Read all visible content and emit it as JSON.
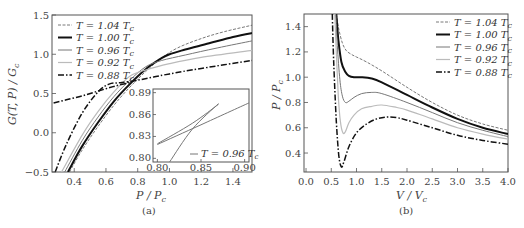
{
  "chart_data": [
    {
      "id": "a",
      "type": "line",
      "caption": "(a)",
      "xlabel": "P / P_c",
      "xlabel_main": "P / P",
      "xlabel_sub": "c",
      "ylabel": "G(T, P) / G_c",
      "ylabel_main": "G(T, P) / G",
      "ylabel_sub": "c",
      "xlim": [
        0.26,
        1.52
      ],
      "ylim": [
        -0.5,
        1.5
      ],
      "xticks": [
        0.4,
        0.6,
        0.8,
        1.0,
        1.2,
        1.4
      ],
      "xtick_labels": [
        "0.4",
        "0.6",
        "0.8",
        "1.0",
        "1.2",
        "1.4"
      ],
      "yticks": [
        -0.5,
        0.0,
        0.5,
        1.0,
        1.5
      ],
      "ytick_labels": [
        "−0.5",
        "0.0",
        "0.5",
        "1.0",
        "1.5"
      ],
      "grid": false,
      "legend_position": "upper left",
      "series": [
        {
          "name": "T = 1.04 T_c",
          "label_main": "T = 1.04 T",
          "label_sub": "c",
          "style": "dashed-thin",
          "color": "#555555",
          "x": [
            0.37,
            0.45,
            0.55,
            0.65,
            0.75,
            0.85,
            0.95,
            1.05,
            1.2,
            1.35,
            1.52
          ],
          "y": [
            -0.5,
            -0.22,
            0.08,
            0.35,
            0.58,
            0.78,
            0.95,
            1.08,
            1.2,
            1.29,
            1.37
          ]
        },
        {
          "name": "T = 1.00 T_c",
          "label_main": "T = 1.00 T",
          "label_sub": "c",
          "style": "solid-thick",
          "color": "#111111",
          "x": [
            0.36,
            0.45,
            0.55,
            0.65,
            0.75,
            0.85,
            0.95,
            1.0,
            1.1,
            1.25,
            1.4,
            1.52
          ],
          "y": [
            -0.5,
            -0.17,
            0.13,
            0.4,
            0.62,
            0.81,
            0.95,
            1.0,
            1.06,
            1.14,
            1.22,
            1.27
          ]
        },
        {
          "name": "T = 0.96 T_c",
          "label_main": "T = 0.96 T",
          "label_sub": "c",
          "style": "solid-medium",
          "color": "#777777",
          "x": [
            0.34,
            0.45,
            0.55,
            0.65,
            0.75,
            0.85,
            0.95,
            1.1,
            1.3,
            1.52
          ],
          "y": [
            -0.5,
            -0.1,
            0.2,
            0.46,
            0.67,
            0.84,
            0.92,
            0.99,
            1.08,
            1.17
          ]
        },
        {
          "name": "T = 0.92 T_c",
          "label_main": "T = 0.92 T",
          "label_sub": "c",
          "style": "solid-light",
          "color": "#bbbbbb",
          "x": [
            0.32,
            0.45,
            0.55,
            0.65,
            0.75,
            0.85,
            1.0,
            1.2,
            1.52
          ],
          "y": [
            -0.5,
            -0.03,
            0.27,
            0.52,
            0.72,
            0.8,
            0.88,
            0.96,
            1.05
          ]
        },
        {
          "name": "T = 0.88 T_c",
          "label_main": "T = 0.88 T",
          "label_sub": "c",
          "style": "dashdot-thick",
          "color": "#111111",
          "x": [
            0.28,
            0.35,
            0.45,
            0.55,
            0.62,
            0.7,
            0.8,
            0.9,
            1.0,
            1.2,
            1.52
          ],
          "y": [
            -0.5,
            -0.15,
            0.25,
            0.52,
            0.62,
            0.64,
            0.67,
            0.71,
            0.75,
            0.82,
            0.92
          ]
        },
        {
          "name": "T = 0.88 T_c (metastable branch)",
          "style": "dashdot-thick",
          "color": "#111111",
          "legend": false,
          "x": [
            0.27,
            0.35,
            0.45,
            0.55,
            0.65,
            0.75
          ],
          "y": [
            0.38,
            0.42,
            0.47,
            0.53,
            0.59,
            0.64
          ]
        }
      ],
      "inset": {
        "xlim": [
          0.795,
          0.905
        ],
        "ylim": [
          0.795,
          0.895
        ],
        "xticks": [
          0.8,
          0.85,
          0.9
        ],
        "xtick_labels": [
          "0.80",
          "0.85",
          "0.90"
        ],
        "yticks": [
          0.8,
          0.83,
          0.86,
          0.89
        ],
        "ytick_labels": [
          "0.80",
          "0.83",
          "0.86",
          "0.89"
        ],
        "legend_main": "T = 0.96 T",
        "legend_sub": "c",
        "series": [
          {
            "name": "branch-1",
            "x": [
              0.8,
              0.84,
              0.87
            ],
            "y": [
              0.82,
              0.848,
              0.874
            ]
          },
          {
            "name": "branch-2",
            "x": [
              0.8,
              0.85,
              0.905
            ],
            "y": [
              0.819,
              0.846,
              0.876
            ]
          },
          {
            "name": "branch-3",
            "x": [
              0.814,
              0.84,
              0.87
            ],
            "y": [
              0.795,
              0.84,
              0.875
            ]
          }
        ]
      }
    },
    {
      "id": "b",
      "type": "line",
      "caption": "(b)",
      "xlabel": "V / V_c",
      "xlabel_main": "V / V",
      "xlabel_sub": "c",
      "ylabel": "P / P_c",
      "ylabel_main": "P / P",
      "ylabel_sub": "c",
      "xlim": [
        -0.04,
        4.0
      ],
      "ylim": [
        0.25,
        1.5
      ],
      "xticks": [
        0.0,
        0.5,
        1.0,
        1.5,
        2.0,
        2.5,
        3.0,
        3.5,
        4.0
      ],
      "xtick_labels": [
        "0.0",
        "0.5",
        "1.0",
        "1.5",
        "2.0",
        "2.5",
        "3.0",
        "3.5",
        "4.0"
      ],
      "yticks": [
        0.4,
        0.6,
        0.8,
        1.0,
        1.2,
        1.4
      ],
      "ytick_labels": [
        "0.4",
        "0.6",
        "0.8",
        "1.0",
        "1.2",
        "1.4"
      ],
      "grid": false,
      "legend_position": "upper right",
      "series": [
        {
          "name": "T = 1.04 T_c",
          "label_main": "T = 1.04 T",
          "label_sub": "c",
          "style": "dashed-thin",
          "color": "#555555",
          "x": [
            0.6,
            0.65,
            0.72,
            0.8,
            0.9,
            1.0,
            1.2,
            1.5,
            2.0,
            2.5,
            3.0,
            3.5,
            4.0
          ],
          "y": [
            1.5,
            1.38,
            1.27,
            1.21,
            1.18,
            1.16,
            1.12,
            1.05,
            0.92,
            0.8,
            0.7,
            0.63,
            0.58
          ]
        },
        {
          "name": "T = 1.00 T_c",
          "label_main": "T = 1.00 T",
          "label_sub": "c",
          "style": "solid-thick",
          "color": "#111111",
          "x": [
            0.6,
            0.64,
            0.7,
            0.78,
            0.85,
            0.95,
            1.1,
            1.3,
            1.5,
            2.0,
            2.5,
            3.0,
            3.5,
            4.0
          ],
          "y": [
            1.5,
            1.3,
            1.12,
            1.04,
            1.01,
            1.0,
            1.0,
            0.99,
            0.96,
            0.86,
            0.76,
            0.67,
            0.6,
            0.55
          ]
        },
        {
          "name": "T = 0.96 T_c",
          "label_main": "T = 0.96 T",
          "label_sub": "c",
          "style": "solid-medium",
          "color": "#777777",
          "x": [
            0.59,
            0.62,
            0.67,
            0.72,
            0.78,
            0.85,
            0.95,
            1.1,
            1.3,
            1.5,
            2.0,
            2.5,
            3.0,
            3.5,
            4.0
          ],
          "y": [
            1.5,
            1.25,
            0.98,
            0.85,
            0.8,
            0.81,
            0.84,
            0.87,
            0.88,
            0.87,
            0.8,
            0.72,
            0.64,
            0.58,
            0.53
          ]
        },
        {
          "name": "T = 0.92 T_c",
          "label_main": "T = 0.92 T",
          "label_sub": "c",
          "style": "solid-light",
          "color": "#bbbbbb",
          "x": [
            0.57,
            0.6,
            0.64,
            0.68,
            0.73,
            0.78,
            0.85,
            0.95,
            1.1,
            1.3,
            1.5,
            1.8,
            2.0,
            2.5,
            3.0,
            3.5,
            4.0
          ],
          "y": [
            1.5,
            1.2,
            0.85,
            0.65,
            0.56,
            0.57,
            0.64,
            0.7,
            0.75,
            0.77,
            0.78,
            0.76,
            0.74,
            0.67,
            0.6,
            0.55,
            0.51
          ]
        },
        {
          "name": "T = 0.88 T_c",
          "label_main": "T = 0.88 T",
          "label_sub": "c",
          "style": "dashdot-thick",
          "color": "#111111",
          "x": [
            0.52,
            0.55,
            0.6,
            0.65,
            0.7,
            0.75,
            0.85,
            1.0,
            1.2,
            1.4,
            1.6,
            1.8,
            2.0,
            2.5,
            3.0,
            3.5,
            4.0
          ],
          "y": [
            1.5,
            1.1,
            0.65,
            0.38,
            0.29,
            0.33,
            0.45,
            0.56,
            0.63,
            0.67,
            0.685,
            0.68,
            0.66,
            0.6,
            0.54,
            0.5,
            0.47
          ]
        }
      ]
    }
  ]
}
